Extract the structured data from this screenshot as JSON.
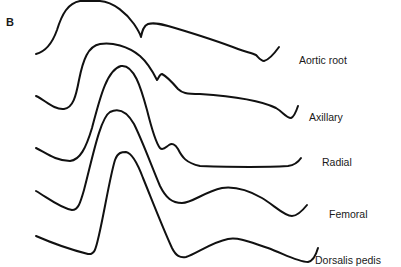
{
  "figure": {
    "panel_letter": "B",
    "line_color": "#111111",
    "background": "#ffffff"
  },
  "traces": [
    {
      "label": "Aortic root",
      "label_pos": [
        299,
        55
      ],
      "path": "M36,54 C44,52 52,44 57,30 C62,14 68,3 80,1 L100,1 C114,2 127,14 134,24 C138,30 140,33 141,37 C142,32 143,26 148,24 C154,22 162,24 175,28 C195,34 220,42 238,49 C246,52 252,53 256,55 C259,58 261,61 264,61 C268,60 274,54 279,47"
    },
    {
      "label": "Axillary",
      "label_pos": [
        309,
        112
      ],
      "path": "M36,96 C45,100 54,110 64,109 C73,108 76,96 79,80 C83,60 88,46 100,44 C112,42 128,46 140,56 C148,63 153,72 157,80 C159,77 160,74 162,74 C166,76 172,82 178,89 C182,93 186,94 200,94 C230,96 260,100 276,108 C283,112 286,118 291,118 C294,117 296,112 298,106"
    },
    {
      "label": "Radial",
      "label_pos": [
        322,
        157
      ],
      "path": "M36,148 C46,153 56,161 70,161 C80,160 86,148 92,128 C99,102 106,70 121,66 C134,64 141,88 147,110 C151,126 155,142 160,148 C163,151 166,147 169,145 C172,143 175,144 178,149 C182,157 186,163 200,166 C230,167 270,167 288,166 C295,165 299,161 301,158"
    },
    {
      "label": "Femoral",
      "label_pos": [
        329,
        209
      ],
      "path": "M36,191 C48,198 60,208 72,210 C78,210 80,204 84,190 C92,160 100,118 110,112 C118,108 126,110 134,124 C142,140 150,162 160,186 C166,198 172,203 182,203 C192,203 204,192 222,188 C236,186 248,190 262,198 C274,205 284,216 292,216 C298,216 303,210 307,205"
    },
    {
      "label": "Dorsalis pedis",
      "label_pos": [
        315,
        255
      ],
      "path": "M36,236 C52,243 72,250 88,254 C95,255 96,248 99,235 C104,214 110,176 115,160 C118,152 122,152 126,152 C132,153 137,162 143,178 C152,200 162,226 172,248 C176,256 180,258 186,257 C196,254 212,242 228,239 C240,237 252,243 268,248 C284,254 298,262 308,262 C313,261 316,255 318,248"
    }
  ]
}
